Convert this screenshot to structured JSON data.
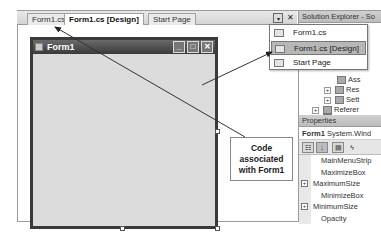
{
  "tabs": [
    {
      "label": "Form1.cs",
      "active": false
    },
    {
      "label": "Form1.cs [Design]",
      "active": true
    },
    {
      "label": "Start Page",
      "active": false
    }
  ],
  "tab_controls": {
    "dropdown_icon": "▾",
    "close_icon": "✕"
  },
  "form": {
    "title": "Form1",
    "caption_buttons": {
      "minimize": "_",
      "maximize": "□",
      "close": "✕"
    }
  },
  "dropdown_menu": {
    "items": [
      {
        "label": "Form1.cs",
        "selected": false
      },
      {
        "label": "Form1.cs [Design]",
        "selected": true
      },
      {
        "label": "Start Page",
        "selected": false
      }
    ]
  },
  "solution_explorer": {
    "title": "Solution Explorer - So",
    "items": [
      {
        "label": "Ass",
        "expander": ""
      },
      {
        "label": "Res",
        "expander": "+"
      },
      {
        "label": "Sett",
        "expander": "+"
      },
      {
        "label": "Referer",
        "expander": "+"
      },
      {
        "label": "bin",
        "expander": "+"
      }
    ]
  },
  "properties": {
    "title": "Properties",
    "object_name": "Form1",
    "object_type": "System.Wind",
    "toolbar": [
      "categorized",
      "alphabetical",
      "properties",
      "events"
    ],
    "rows": [
      {
        "label": "MainMenuStrip",
        "expander": ""
      },
      {
        "label": "MaximizeBox",
        "expander": ""
      },
      {
        "label": "MaximumSize",
        "expander": "+"
      },
      {
        "label": "MinimizeBox",
        "expander": ""
      },
      {
        "label": "MinimumSize",
        "expander": "+"
      },
      {
        "label": "Opacity",
        "expander": ""
      }
    ]
  },
  "callout": {
    "line1": "Code",
    "line2": "associated",
    "line3": "with Form1"
  }
}
